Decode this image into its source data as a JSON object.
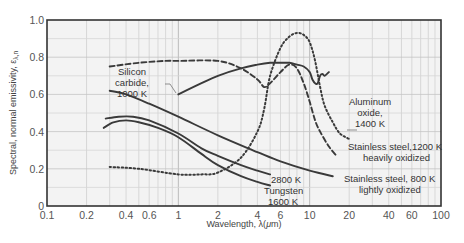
{
  "chart_data": {
    "type": "line",
    "title": "",
    "xlabel": "Wavelength, λ(μm)",
    "ylabel": "Spectral, normal emissivity, ελ,n",
    "xscale": "log",
    "xlim": [
      0.1,
      100
    ],
    "ylim": [
      0,
      1.0
    ],
    "grid": true,
    "legend": "inline annotations",
    "x_ticks": [
      "0.1",
      "0.2",
      "0.4",
      "0.6",
      "1",
      "2",
      "4",
      "6",
      "10",
      "20",
      "40",
      "60",
      "100"
    ],
    "y_ticks": [
      "0",
      "0.2",
      "0.4",
      "0.6",
      "0.8",
      "1.0"
    ],
    "series": [
      {
        "name": "Silicon carbide, 1000 K",
        "style": "solid",
        "x": [
          1.0,
          1.5,
          2.0,
          3.0,
          4.0,
          5.0,
          6.0,
          7.0,
          8.0,
          9.0,
          10.0,
          10.5,
          11.0,
          11.5,
          12.0,
          12.5,
          13.0,
          14.0
        ],
        "y": [
          0.6,
          0.66,
          0.7,
          0.74,
          0.76,
          0.77,
          0.77,
          0.77,
          0.76,
          0.75,
          0.72,
          0.68,
          0.66,
          0.66,
          0.7,
          0.71,
          0.7,
          0.72
        ]
      },
      {
        "name": "Stainless steel, 1200 K, heavily oxidized",
        "style": "dashed",
        "x": [
          0.3,
          0.5,
          0.8,
          1.0,
          2.0,
          3.0,
          4.0,
          4.5,
          5.0,
          6.0,
          7.0,
          8.0,
          9.0,
          10.0,
          11.0,
          12.0,
          14.0,
          16.0
        ],
        "y": [
          0.75,
          0.77,
          0.78,
          0.78,
          0.78,
          0.74,
          0.68,
          0.64,
          0.66,
          0.72,
          0.76,
          0.74,
          0.66,
          0.56,
          0.46,
          0.4,
          0.32,
          0.27
        ]
      },
      {
        "name": "Aluminum oxide, 1400 K",
        "style": "dotted",
        "x": [
          0.3,
          0.5,
          1.0,
          1.5,
          2.0,
          3.0,
          4.0,
          4.5,
          5.0,
          6.0,
          7.0,
          8.0,
          9.0,
          10.0,
          11.0,
          12.0,
          13.0,
          15.0,
          17.0,
          20.0
        ],
        "y": [
          0.21,
          0.2,
          0.17,
          0.17,
          0.18,
          0.26,
          0.4,
          0.52,
          0.7,
          0.85,
          0.91,
          0.93,
          0.92,
          0.88,
          0.78,
          0.64,
          0.54,
          0.45,
          0.39,
          0.36
        ]
      },
      {
        "name": "Stainless steel, 800 K, lightly oxidized",
        "style": "solid",
        "x": [
          0.3,
          0.4,
          0.6,
          1.0,
          2.0,
          4.0,
          6.0,
          10.0,
          15.0
        ],
        "y": [
          0.62,
          0.6,
          0.55,
          0.48,
          0.38,
          0.29,
          0.24,
          0.19,
          0.16
        ]
      },
      {
        "name": "Tungsten, 2800 K",
        "style": "solid",
        "x": [
          0.28,
          0.35,
          0.45,
          0.6,
          1.0,
          1.5,
          2.0,
          3.0,
          4.0,
          5.0
        ],
        "y": [
          0.47,
          0.48,
          0.48,
          0.46,
          0.39,
          0.31,
          0.27,
          0.22,
          0.19,
          0.17
        ]
      },
      {
        "name": "Tungsten, 1600 K",
        "style": "solid",
        "x": [
          0.27,
          0.32,
          0.4,
          0.5,
          0.7,
          1.0,
          1.5,
          2.0,
          3.0,
          4.0,
          5.0
        ],
        "y": [
          0.42,
          0.45,
          0.46,
          0.45,
          0.42,
          0.37,
          0.28,
          0.22,
          0.16,
          0.13,
          0.11
        ]
      }
    ],
    "annotations": [
      {
        "text": [
          "Silicon",
          "carbide,",
          "1000 K"
        ]
      },
      {
        "text": [
          "Aluminum",
          "oxide,",
          "1400 K"
        ]
      },
      {
        "text": [
          "Stainless steel,1200 K",
          "heavily oxidized"
        ]
      },
      {
        "text": [
          "Stainless steel, 800 K",
          "lightly oxidized"
        ]
      },
      {
        "text": [
          "2800 K",
          "Tungsten",
          "1600 K"
        ]
      }
    ]
  },
  "axes": {
    "xlabel": "Wavelength, λ(",
    "xlabel_mu": "μ",
    "xlabel_tail": "m)",
    "ylabel": "Spectral, normal emissivity, ε",
    "ylabel_sub": "λ,n"
  },
  "labels": {
    "sic_1": "Silicon",
    "sic_2": "carbide,",
    "sic_3": "1000 K",
    "al_1": "Aluminum",
    "al_2": "oxide,",
    "al_3": "1400 K",
    "ss1200_1": "Stainless steel,1200 K",
    "ss1200_2": "heavily oxidized",
    "ss800_1": "Stainless steel, 800 K",
    "ss800_2": "lightly oxidized",
    "w_1": "2800 K",
    "w_2": "Tungsten",
    "w_3": "1600 K"
  }
}
